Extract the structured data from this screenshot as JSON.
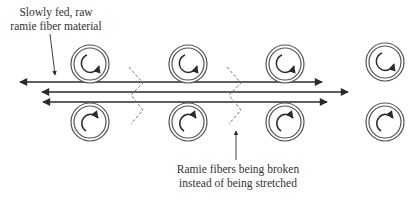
{
  "diagram": {
    "annotations": {
      "feed": {
        "line1": "Slowly fed, raw",
        "line2": "ramie fiber material"
      },
      "broken": {
        "line1": "Ramie fibers being broken",
        "line2": "instead of being stretched"
      }
    },
    "rollers": {
      "columns_x": [
        90,
        188,
        285,
        385
      ],
      "top_row_y": 64,
      "bottom_row_y": 122,
      "outer_radius": 19,
      "inner_radius": 16,
      "top_rotation": "clockwise-bottom-arrow",
      "bottom_rotation": "clockwise-top-arrow"
    },
    "fiber_lines": [
      {
        "name": "upper-fiber-line",
        "y": 82,
        "x_start": 20,
        "x_end": 322,
        "arrows": "both"
      },
      {
        "name": "middle-fiber-line",
        "y": 92,
        "x_start": 42,
        "x_end": 348,
        "arrows": "both"
      },
      {
        "name": "lower-fiber-line",
        "y": 102,
        "x_start": 43,
        "x_end": 327,
        "arrows": "both"
      }
    ],
    "break_zigzags_x": [
      129,
      227
    ],
    "colors": {
      "stroke": "#2a2a2a",
      "roller_ring": "#555555",
      "dashed": "#777777",
      "background": "#ffffff"
    }
  }
}
